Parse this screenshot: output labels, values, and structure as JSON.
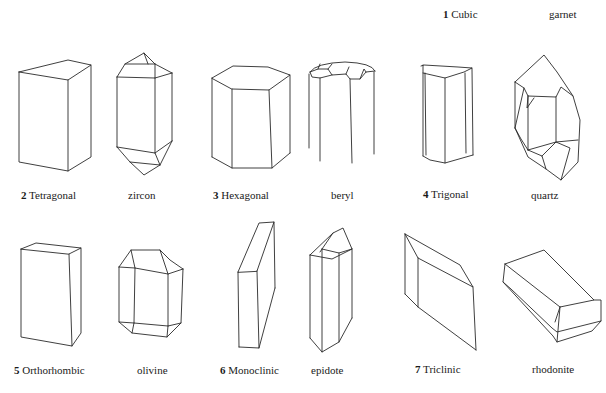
{
  "figure": {
    "systems": [
      {
        "number": "1",
        "name": "Cubic",
        "mineral": "garnet"
      },
      {
        "number": "2",
        "name": "Tetragonal",
        "mineral": "zircon"
      },
      {
        "number": "3",
        "name": "Hexagonal",
        "mineral": "beryl"
      },
      {
        "number": "4",
        "name": "Trigonal",
        "mineral": "quartz"
      },
      {
        "number": "5",
        "name": "Orthorhombic",
        "mineral": "olivine"
      },
      {
        "number": "6",
        "name": "Monoclinic",
        "mineral": "epidote"
      },
      {
        "number": "7",
        "name": "Triclinic",
        "mineral": "rhodonite"
      }
    ]
  }
}
